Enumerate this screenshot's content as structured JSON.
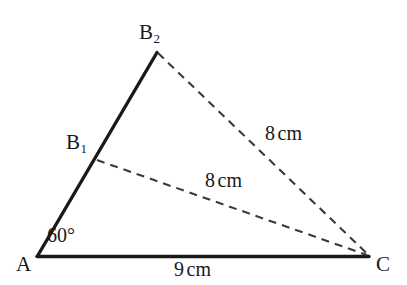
{
  "figure": {
    "type": "geometry-diagram",
    "background_color": "#ffffff",
    "stroke_color": "#191919",
    "dashed_stroke_color": "#3a3a3a",
    "width": 407,
    "height": 285
  },
  "vertices": {
    "a": {
      "label": "A",
      "x": 37,
      "y": 256
    },
    "c": {
      "label": "C",
      "x": 368,
      "y": 256
    },
    "b1": {
      "label": "B",
      "subscript": "1",
      "x": 97,
      "y": 160
    },
    "b2": {
      "label": "B",
      "subscript": "2",
      "x": 157,
      "y": 52
    }
  },
  "angles": {
    "at_a": "60°"
  },
  "measurements": {
    "side_ac": {
      "value": "9",
      "unit": "cm"
    },
    "segment_b1c": {
      "value": "8",
      "unit": "cm"
    },
    "segment_b2c": {
      "value": "8",
      "unit": "cm"
    }
  },
  "segments": [
    {
      "name": "base-ac",
      "from": "A",
      "to": "C",
      "style": "solid"
    },
    {
      "name": "ray-ab2",
      "from": "A",
      "to": "B2",
      "style": "solid"
    },
    {
      "name": "chord-b1c",
      "from": "B1",
      "to": "C",
      "style": "dashed"
    },
    {
      "name": "chord-b2c",
      "from": "B2",
      "to": "C",
      "style": "dashed"
    }
  ]
}
